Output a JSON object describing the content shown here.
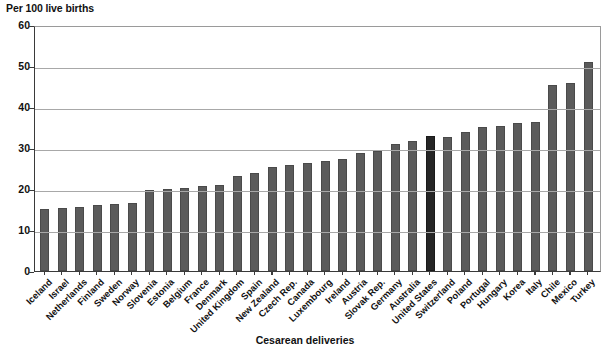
{
  "chart_data": {
    "type": "bar",
    "title": "",
    "ylabel": "Per 100 live births",
    "xlabel": "Cesarean deliveries",
    "ylim": [
      0,
      60
    ],
    "yticks": [
      0,
      10,
      20,
      30,
      40,
      50,
      60
    ],
    "grid": true,
    "legend": "none",
    "highlight_category": "United States",
    "colors": {
      "bar": "#5b5b5b",
      "bar_highlight": "#262626",
      "gridline": "#a8a8a8",
      "axis": "#3a3a3a",
      "text": "#111111",
      "background": "#ffffff"
    },
    "categories": [
      "Iceland",
      "Israel",
      "Netherlands",
      "Finland",
      "Sweden",
      "Norway",
      "Slovenia",
      "Estonia",
      "Belgium",
      "France",
      "Denmark",
      "United Kingdom",
      "Spain",
      "New Zealand",
      "Czech Rep.",
      "Canada",
      "Luxembourg",
      "Ireland",
      "Austria",
      "Slovak Rep.",
      "Germany",
      "Australia",
      "United States",
      "Switzerland",
      "Poland",
      "Portugal",
      "Hungary",
      "Korea",
      "Italy",
      "Chile",
      "Mexico",
      "Turkey"
    ],
    "values": [
      15.2,
      15.3,
      15.6,
      16.0,
      16.3,
      16.5,
      19.7,
      20.0,
      20.3,
      20.8,
      21.1,
      23.2,
      23.8,
      25.4,
      25.8,
      26.3,
      26.8,
      27.4,
      28.8,
      29.2,
      31.1,
      31.6,
      32.9,
      32.8,
      34.0,
      35.1,
      35.3,
      36.0,
      36.3,
      45.5,
      45.9,
      51.0
    ]
  }
}
